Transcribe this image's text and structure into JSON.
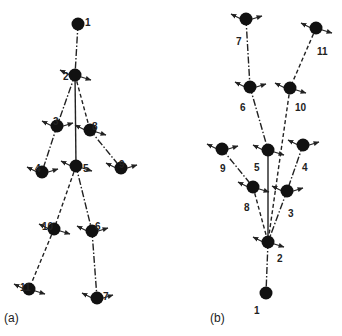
{
  "diagrams": [
    {
      "id": "a",
      "caption": "(a)",
      "caption_pos": [
        4,
        322
      ],
      "nodes": [
        {
          "label": "1",
          "x": 78,
          "y": 24,
          "lx": 85,
          "ly": 18
        },
        {
          "label": "2",
          "x": 75,
          "y": 75,
          "lx": 63,
          "ly": 72
        },
        {
          "label": "3",
          "x": 57,
          "y": 126,
          "lx": 53,
          "ly": 117
        },
        {
          "label": "8",
          "x": 90,
          "y": 130,
          "lx": 92,
          "ly": 122
        },
        {
          "label": "4",
          "x": 42,
          "y": 172,
          "lx": 35,
          "ly": 164
        },
        {
          "label": "5",
          "x": 76,
          "y": 166,
          "lx": 83,
          "ly": 164
        },
        {
          "label": "9",
          "x": 121,
          "y": 168,
          "lx": 119,
          "ly": 160
        },
        {
          "label": "10",
          "x": 54,
          "y": 229,
          "lx": 42,
          "ly": 222
        },
        {
          "label": "6",
          "x": 92,
          "y": 231,
          "lx": 95,
          "ly": 222
        },
        {
          "label": "11",
          "x": 29,
          "y": 289,
          "lx": 20,
          "ly": 283
        },
        {
          "label": "7",
          "x": 97,
          "y": 298,
          "lx": 103,
          "ly": 292
        }
      ],
      "edges": [
        {
          "from": "1",
          "to": "2",
          "style": "dashdot"
        },
        {
          "from": "2",
          "to": "3",
          "style": "dashdot"
        },
        {
          "from": "2",
          "to": "5",
          "style": "solid"
        },
        {
          "from": "2",
          "to": "8",
          "style": "dashed"
        },
        {
          "from": "3",
          "to": "4",
          "style": "dashdot"
        },
        {
          "from": "8",
          "to": "9",
          "style": "dashdot"
        },
        {
          "from": "5",
          "to": "6",
          "style": "dashdot"
        },
        {
          "from": "6",
          "to": "7",
          "style": "dashdot"
        },
        {
          "from": "10",
          "to": "11",
          "style": "dashed"
        },
        {
          "from": "5",
          "to": "10",
          "style": "dashed"
        }
      ]
    },
    {
      "id": "b",
      "caption": "(b)",
      "caption_pos": [
        210,
        322
      ],
      "nodes": [
        {
          "label": "7",
          "x": 246,
          "y": 19,
          "lx": 236,
          "ly": 37
        },
        {
          "label": "11",
          "x": 316,
          "y": 28,
          "lx": 317,
          "ly": 47
        },
        {
          "label": "6",
          "x": 250,
          "y": 87,
          "lx": 240,
          "ly": 103
        },
        {
          "label": "10",
          "x": 290,
          "y": 88,
          "lx": 295,
          "ly": 103
        },
        {
          "label": "9",
          "x": 222,
          "y": 149,
          "lx": 220,
          "ly": 164
        },
        {
          "label": "5",
          "x": 268,
          "y": 150,
          "lx": 254,
          "ly": 163
        },
        {
          "label": "4",
          "x": 303,
          "y": 145,
          "lx": 302,
          "ly": 163
        },
        {
          "label": "8",
          "x": 253,
          "y": 187,
          "lx": 244,
          "ly": 203
        },
        {
          "label": "3",
          "x": 287,
          "y": 191,
          "lx": 288,
          "ly": 209
        },
        {
          "label": "2",
          "x": 268,
          "y": 242,
          "lx": 277,
          "ly": 254
        },
        {
          "label": "1",
          "x": 266,
          "y": 293,
          "lx": 254,
          "ly": 306
        }
      ],
      "edges": [
        {
          "from": "7",
          "to": "6",
          "style": "dashdot"
        },
        {
          "from": "11",
          "to": "10",
          "style": "dashed"
        },
        {
          "from": "6",
          "to": "5",
          "style": "dashdot"
        },
        {
          "from": "10",
          "to": "2",
          "style": "dashed"
        },
        {
          "from": "5",
          "to": "2",
          "style": "solid"
        },
        {
          "from": "9",
          "to": "8",
          "style": "dashdot"
        },
        {
          "from": "4",
          "to": "3",
          "style": "dashdot"
        },
        {
          "from": "3",
          "to": "2",
          "style": "dashdot"
        },
        {
          "from": "8",
          "to": "2",
          "style": "dashed"
        },
        {
          "from": "2",
          "to": "1",
          "style": "dashdot"
        }
      ]
    }
  ],
  "colors": {
    "node": "#111111",
    "line": "#222222",
    "background": "#ffffff"
  }
}
